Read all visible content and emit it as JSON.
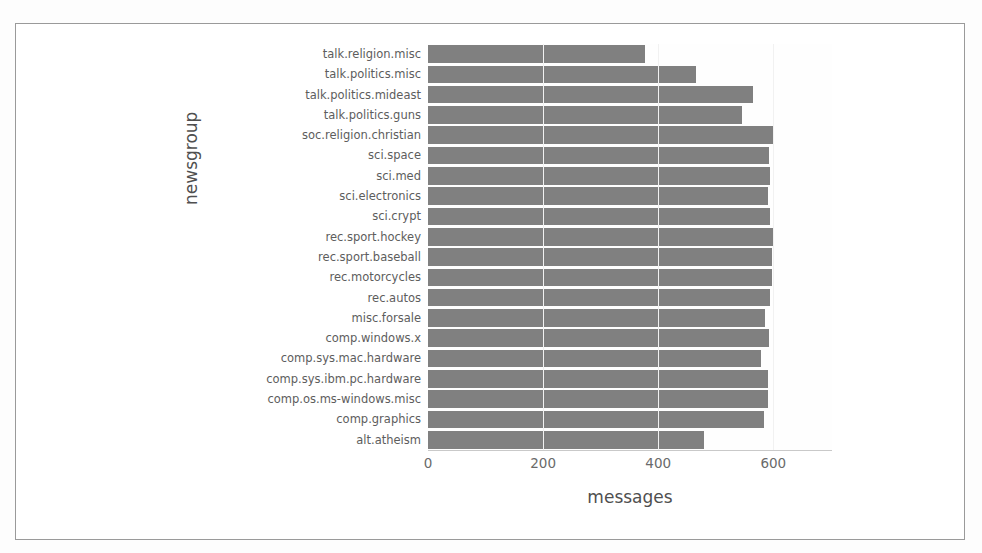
{
  "chart_data": {
    "type": "bar",
    "orientation": "horizontal",
    "title": "",
    "xlabel": "messages",
    "ylabel": "newsgroup",
    "xlim": [
      0,
      702
    ],
    "xticks": [
      0,
      200,
      400,
      600
    ],
    "grid": false,
    "legend": null,
    "bar_color": "#808080",
    "categories": [
      "talk.religion.misc",
      "talk.politics.misc",
      "talk.politics.mideast",
      "talk.politics.guns",
      "soc.religion.christian",
      "sci.space",
      "sci.med",
      "sci.electronics",
      "sci.crypt",
      "rec.sport.hockey",
      "rec.sport.baseball",
      "rec.motorcycles",
      "rec.autos",
      "misc.forsale",
      "comp.windows.x",
      "comp.sys.mac.hardware",
      "comp.sys.ibm.pc.hardware",
      "comp.os.ms-windows.misc",
      "comp.graphics",
      "alt.atheism"
    ],
    "values": [
      377,
      465,
      564,
      546,
      599,
      593,
      594,
      591,
      595,
      600,
      597,
      598,
      594,
      585,
      593,
      578,
      590,
      591,
      584,
      480
    ]
  },
  "axis": {
    "x_title": "messages",
    "y_title": "newsgroup",
    "x_tick_labels": [
      "0",
      "200",
      "400",
      "600"
    ]
  }
}
